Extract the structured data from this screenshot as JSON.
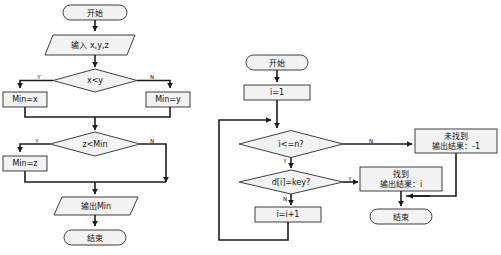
{
  "figure": {
    "title": "",
    "type": "flowchart-pair",
    "background": "#ffffff",
    "shape_fill": "#f2f2f2",
    "shape_stroke": "#3f3f3f",
    "connector_color": "#1c1c1c"
  },
  "left_flowchart": {
    "name": "min-of-three-flowchart",
    "nodes": {
      "start": "开始",
      "input": "输入 x,y,z",
      "decision1": "x<y",
      "assign_min_x": "Min=x",
      "assign_min_y": "Min=y",
      "decision2": "z<Min",
      "assign_min_z": "Min=z",
      "output": "输出Min",
      "end": "结束"
    },
    "edge_labels": {
      "d1_yes": "Y",
      "d1_no": "N",
      "d2_yes": "Y",
      "d2_no": "N"
    }
  },
  "right_flowchart": {
    "name": "linear-search-flowchart",
    "nodes": {
      "start": "开始",
      "init": "i=1",
      "decision_bound": "i<=n?",
      "decision_match": "d[i]=key?",
      "increment": "i=i+1",
      "not_found_line1": "未找到",
      "not_found_line2": "输出结果：-1",
      "found_line1": "找到",
      "found_line2": "输出结果：i",
      "end": "结束"
    },
    "edge_labels": {
      "bound_no": "N",
      "bound_yes": "Y",
      "match_yes": "Y",
      "match_no": "N"
    }
  },
  "caption": {
    "text": ""
  }
}
